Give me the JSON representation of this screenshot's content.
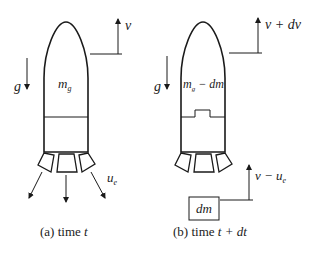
{
  "figure": {
    "panel_a": {
      "caption_prefix": "(a) time ",
      "caption_var": "t",
      "mass_label_base": "m",
      "mass_label_sub": "g",
      "gravity_label": "g",
      "velocity_label": "v",
      "exhaust_label_base": "u",
      "exhaust_label_sub": "e"
    },
    "panel_b": {
      "caption_prefix": "(b) time ",
      "caption_var": "t + dt",
      "mass_label_base": "m",
      "mass_label_sub": "g",
      "mass_label_suffix": " − dm",
      "gravity_label": "g",
      "velocity_label": "v + dv",
      "ejected_mass_label": "dm",
      "ejected_velocity_label": "v − u",
      "ejected_velocity_sub": "e"
    },
    "colors": {
      "line": "#1a1a1a",
      "text": "#222222",
      "background": "#ffffff"
    }
  }
}
